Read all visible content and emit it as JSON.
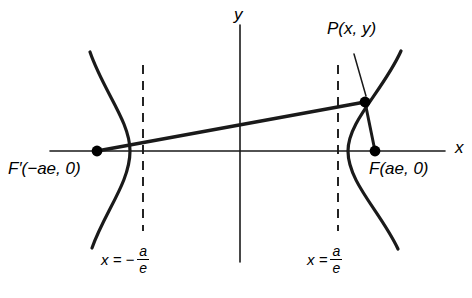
{
  "figure": {
    "width": 472,
    "height": 298,
    "background_color": "#ffffff",
    "ink_color": "#1a1a1a"
  },
  "axes": {
    "x_label": "x",
    "y_label": "y",
    "x_axis": {
      "y": 151,
      "x_start": 50,
      "x_end": 445,
      "stroke_width": 1.6
    },
    "y_axis": {
      "x": 240,
      "y_start": 25,
      "y_end": 262,
      "stroke_width": 1.6
    },
    "origin": {
      "x": 240,
      "y": 151
    }
  },
  "curves": {
    "left_branch": {
      "name": "left-hyperbola-branch",
      "vertex": {
        "x": 130,
        "y": 151
      },
      "top_end": {
        "x": 90,
        "y": 52
      },
      "bottom_end": {
        "x": 92,
        "y": 248
      },
      "stroke_width": 3.2
    },
    "right_branch": {
      "name": "right-hyperbola-branch",
      "vertex": {
        "x": 348,
        "y": 151
      },
      "top_end": {
        "x": 401,
        "y": 51
      },
      "bottom_end": {
        "x": 398,
        "y": 249
      },
      "stroke_width": 3.2
    }
  },
  "directrices": [
    {
      "name": "left-directrix",
      "x": 143,
      "y_start": 65,
      "y_end": 231,
      "label_lhs": "x = −",
      "label_numerator": "a",
      "label_denominator": "e",
      "label_x": 101,
      "label_y": 252
    },
    {
      "name": "right-directrix",
      "x": 338,
      "y_start": 65,
      "y_end": 231,
      "label_lhs": "x =",
      "label_numerator": "a",
      "label_denominator": "e",
      "label_x": 307,
      "label_y": 252
    }
  ],
  "points": [
    {
      "name": "left-focus",
      "label": "F′(−ae, 0)",
      "x": 97,
      "y": 151,
      "radius": 5.4,
      "label_x": 8,
      "label_y": 168
    },
    {
      "name": "right-focus",
      "label": "F(ae, 0)",
      "x": 375,
      "y": 151,
      "radius": 5.4,
      "label_x": 369,
      "label_y": 168
    },
    {
      "name": "point-p",
      "label": "P(x, y)",
      "x": 365,
      "y": 102,
      "radius": 5.4,
      "label_x": 327,
      "label_y": 28
    }
  ],
  "segments": [
    {
      "name": "focal-chord-left",
      "from": {
        "x": 97,
        "y": 151
      },
      "to": {
        "x": 365,
        "y": 102
      },
      "stroke_width": 3.4
    },
    {
      "name": "focal-radius-right",
      "from": {
        "x": 365,
        "y": 102
      },
      "to": {
        "x": 375,
        "y": 151
      },
      "stroke_width": 3.0
    }
  ],
  "leader_line": {
    "name": "p-label-leader",
    "from": {
      "x": 354,
      "y": 54
    },
    "to": {
      "x": 366,
      "y": 96
    },
    "stroke_width": 1.5
  }
}
